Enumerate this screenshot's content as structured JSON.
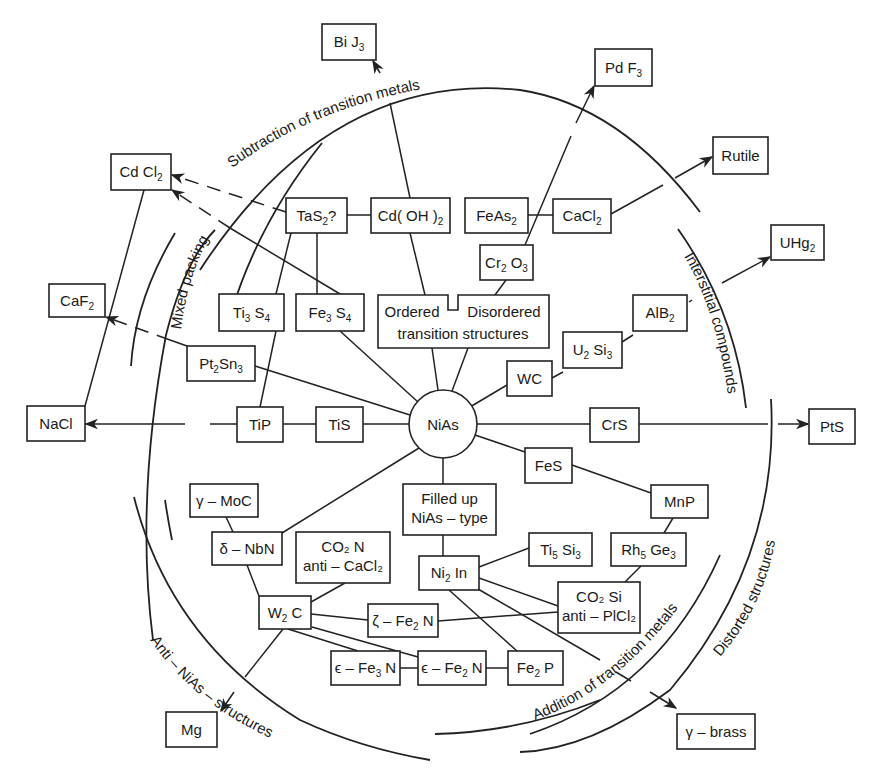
{
  "center": {
    "label": "NiAs",
    "cx": 443,
    "cy": 424,
    "r": 34
  },
  "boxes": [
    {
      "id": "BiJ3",
      "text": "Bi J",
      "sub": "3",
      "x": 322,
      "y": 24,
      "w": 54,
      "h": 36
    },
    {
      "id": "PdF3",
      "text": "Pd F",
      "sub": "3",
      "x": 595,
      "y": 49,
      "w": 57,
      "h": 37
    },
    {
      "id": "Rutile",
      "text": "Rutile",
      "x": 713,
      "y": 137,
      "w": 55,
      "h": 37
    },
    {
      "id": "UHg2",
      "text": "UHg",
      "sub": "2",
      "x": 771,
      "y": 225,
      "w": 53,
      "h": 35
    },
    {
      "id": "CdCl2",
      "text": "Cd Cl",
      "sub": "2",
      "x": 111,
      "y": 154,
      "w": 60,
      "h": 36
    },
    {
      "id": "CaF2",
      "text": "CaF",
      "sub": "2",
      "x": 49,
      "y": 284,
      "w": 56,
      "h": 33
    },
    {
      "id": "NaCl",
      "text": "NaCl",
      "x": 27,
      "y": 406,
      "w": 58,
      "h": 35
    },
    {
      "id": "PtS",
      "text": "PtS",
      "x": 809,
      "y": 409,
      "w": 46,
      "h": 35
    },
    {
      "id": "Mg",
      "text": "Mg",
      "x": 166,
      "y": 712,
      "w": 51,
      "h": 35
    },
    {
      "id": "gbrass",
      "text": "γ – brass",
      "x": 677,
      "y": 714,
      "w": 78,
      "h": 35
    },
    {
      "id": "TaS2",
      "text": "TaS",
      "sub": "2",
      "suffix": "?",
      "x": 286,
      "y": 198,
      "w": 61,
      "h": 35
    },
    {
      "id": "CdOH2",
      "text": "Cd( OH )",
      "sub": "2",
      "x": 371,
      "y": 198,
      "w": 79,
      "h": 35
    },
    {
      "id": "FeAs2",
      "text": "FeAs",
      "sub": "2",
      "x": 465,
      "y": 198,
      "w": 63,
      "h": 35
    },
    {
      "id": "CaCl2",
      "text": "CaCl",
      "sub": "2",
      "x": 553,
      "y": 199,
      "w": 58,
      "h": 34
    },
    {
      "id": "Cr2O3",
      "text": "Cr",
      "sub": "2",
      "text2": " O",
      "sub2": "3",
      "x": 480,
      "y": 245,
      "w": 53,
      "h": 35
    },
    {
      "id": "Ti3S4",
      "text": "Ti",
      "sub": "3",
      "text2": " S",
      "sub2": "4",
      "x": 219,
      "y": 294,
      "w": 65,
      "h": 37
    },
    {
      "id": "Fe3S4",
      "text": "Fe",
      "sub": "3",
      "text2": " S",
      "sub2": "4",
      "x": 296,
      "y": 294,
      "w": 68,
      "h": 37
    },
    {
      "id": "Pt2Sn3",
      "text": "Pt",
      "sub": "2",
      "text2": "Sn",
      "sub2": "3",
      "x": 187,
      "y": 346,
      "w": 68,
      "h": 35
    },
    {
      "id": "AlB2",
      "text": "AlB",
      "sub": "2",
      "x": 633,
      "y": 295,
      "w": 54,
      "h": 36
    },
    {
      "id": "U2Si3",
      "text": "U",
      "sub": "2",
      "text2": " Si",
      "sub2": "3",
      "x": 563,
      "y": 332,
      "w": 59,
      "h": 36
    },
    {
      "id": "WC",
      "text": "WC",
      "x": 507,
      "y": 361,
      "w": 45,
      "h": 35
    },
    {
      "id": "TiP",
      "text": "TiP",
      "x": 237,
      "y": 407,
      "w": 46,
      "h": 35
    },
    {
      "id": "TiS",
      "text": "TiS",
      "x": 316,
      "y": 407,
      "w": 47,
      "h": 35
    },
    {
      "id": "CrS",
      "text": "CrS",
      "x": 590,
      "y": 408,
      "w": 49,
      "h": 34
    },
    {
      "id": "FeS",
      "text": "FeS",
      "x": 525,
      "y": 448,
      "w": 47,
      "h": 35
    },
    {
      "id": "MnP",
      "text": "MnP",
      "x": 651,
      "y": 485,
      "w": 57,
      "h": 33
    },
    {
      "id": "gMoC",
      "text": "γ – MoC",
      "x": 190,
      "y": 484,
      "w": 68,
      "h": 33
    },
    {
      "id": "dNbN",
      "text": "δ – NbN",
      "x": 212,
      "y": 532,
      "w": 70,
      "h": 33
    },
    {
      "id": "FilledUp",
      "lines": [
        "Filled up",
        "NiAs – type"
      ],
      "x": 403,
      "y": 484,
      "w": 93,
      "h": 51
    },
    {
      "id": "Co2N",
      "lines": [
        "CO₂ N",
        "anti – CaCl₂"
      ],
      "x": 296,
      "y": 532,
      "w": 94,
      "h": 51
    },
    {
      "id": "Ti5Si3",
      "text": "Ti",
      "sub": "5",
      "text2": " Si",
      "sub2": "3",
      "x": 529,
      "y": 533,
      "w": 63,
      "h": 33
    },
    {
      "id": "Rh5Ge3",
      "text": "Rh",
      "sub": "5",
      "text2": " Ge",
      "sub2": "3",
      "x": 611,
      "y": 533,
      "w": 75,
      "h": 33
    },
    {
      "id": "Ni2In",
      "text": "Ni",
      "sub": "2",
      "text2": " In",
      "x": 419,
      "y": 556,
      "w": 60,
      "h": 34
    },
    {
      "id": "Co2Si",
      "lines": [
        "CO₂ Si",
        "anti – PlCl₂"
      ],
      "x": 558,
      "y": 582,
      "w": 82,
      "h": 51
    },
    {
      "id": "W2C",
      "text": "W",
      "sub": "2",
      "text2": " C",
      "x": 259,
      "y": 596,
      "w": 52,
      "h": 33
    },
    {
      "id": "zFe2N",
      "text": "ζ – Fe",
      "sub": "2",
      "text2": " N",
      "x": 368,
      "y": 604,
      "w": 70,
      "h": 33
    },
    {
      "id": "eFe3N",
      "text": "ϵ – Fe",
      "sub": "3",
      "text2": " N",
      "x": 331,
      "y": 651,
      "w": 69,
      "h": 34
    },
    {
      "id": "eFe2N",
      "text": "ϵ – Fe",
      "sub": "2",
      "text2": " N",
      "x": 418,
      "y": 651,
      "w": 68,
      "h": 34
    },
    {
      "id": "Fe2P",
      "text": "Fe",
      "sub": "2",
      "text2": " P",
      "x": 508,
      "y": 651,
      "w": 55,
      "h": 34
    }
  ],
  "transition_box": {
    "left_label": "Ordered",
    "right_label": "Disordered",
    "bottom_label": "transition structures",
    "x": 378,
    "y": 295,
    "w": 171,
    "h": 53
  },
  "arc_labels": [
    {
      "id": "subtraction",
      "text": "Subtraction of transition metals"
    },
    {
      "id": "interstitial",
      "text": "Interstitial compounds"
    },
    {
      "id": "mixed",
      "text": "Mixed packing"
    },
    {
      "id": "anti",
      "text": "Anti – NiAs – structures"
    },
    {
      "id": "addition",
      "text": "Addition of transition metals"
    },
    {
      "id": "distorted",
      "text": "Distorted structures"
    }
  ]
}
